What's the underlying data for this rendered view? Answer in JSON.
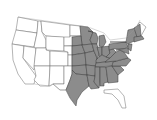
{
  "map": {
    "type": "range-map",
    "region": "Contiguous United States",
    "colors": {
      "background": "#ffffff",
      "unshaded_fill": "#ffffff",
      "shaded_fill": "#8c8c8c",
      "border": "#6a6a6a"
    },
    "shaded_states": [
      "ND-east? no",
      "MN",
      "IA",
      "MO",
      "AR",
      "LA",
      "WI",
      "IL",
      "IN",
      "OH",
      "MI",
      "KY",
      "TN",
      "MS",
      "AL",
      "GA",
      "SC",
      "NC",
      "VA",
      "WV",
      "PA",
      "NY",
      "MD",
      "DE",
      "NJ",
      "CT",
      "RI",
      "MA",
      "VT",
      "NH",
      "NE-east",
      "KS-east",
      "OK",
      "TX-east",
      "SD-east"
    ],
    "unshaded_states": [
      "WA",
      "OR",
      "CA",
      "NV",
      "ID",
      "MT",
      "WY",
      "UT",
      "CO",
      "AZ",
      "NM",
      "ND",
      "FL",
      "ME"
    ]
  }
}
